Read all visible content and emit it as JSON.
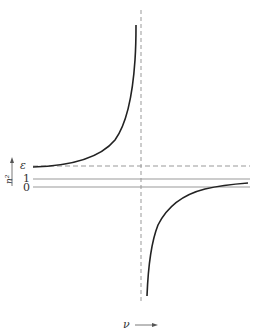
{
  "diagram": {
    "title": "",
    "y_axis_label": "n²",
    "x_axis_label": "ν",
    "y_ticks": [
      {
        "label": "ε",
        "y_px": 166,
        "style": "dashed"
      },
      {
        "label": "1",
        "y_px": 179,
        "style": "solid"
      },
      {
        "label": "0",
        "y_px": 187,
        "style": "solid"
      }
    ],
    "asymptote": {
      "x_px": 141,
      "style": "dashed",
      "orientation": "vertical"
    },
    "curves": [
      {
        "name": "upper-branch",
        "description": "starts at ε on left, rises to +∞ approaching resonance"
      },
      {
        "name": "lower-branch",
        "description": "from −∞ just right of resonance, rises toward 1 at large ν"
      }
    ],
    "colors": {
      "curve": "#222222",
      "guide": "#999999",
      "text": "#333333"
    }
  }
}
